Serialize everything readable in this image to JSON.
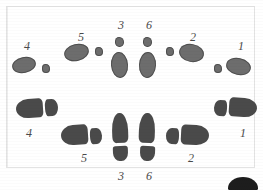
{
  "figure": {
    "background_color": "#ffffff",
    "print_fill_color": "#6d6d6d",
    "shoe_fill_color": "#4a4a4a",
    "label_color": "#4a4a4a",
    "frame_color": "#e3e3e3"
  },
  "rows": [
    {
      "name": "top-row-pad-prints",
      "kind": "pad",
      "prints": [
        {
          "id": "pad-4",
          "label": "4",
          "label_pos": {
            "x": 24,
            "y": 40
          },
          "parts": [
            {
              "part": "pad",
              "x": 12,
              "y": 57,
              "w": 24,
              "h": 16,
              "rotate": -12
            },
            {
              "part": "dot",
              "x": 42,
              "y": 64,
              "w": 8,
              "h": 9,
              "rotate": 0
            }
          ]
        },
        {
          "id": "pad-5",
          "label": "5",
          "label_pos": {
            "x": 78,
            "y": 31
          },
          "parts": [
            {
              "part": "pad",
              "x": 64,
              "y": 44,
              "w": 25,
              "h": 17,
              "rotate": -14
            },
            {
              "part": "dot",
              "x": 95,
              "y": 47,
              "w": 8,
              "h": 9,
              "rotate": 0
            }
          ]
        },
        {
          "id": "pad-3",
          "label": "3",
          "label_pos": {
            "x": 118,
            "y": 19
          },
          "parts": [
            {
              "part": "dot",
              "x": 115,
              "y": 37,
              "w": 9,
              "h": 10,
              "rotate": 0
            },
            {
              "part": "pad",
              "x": 111,
              "y": 52,
              "w": 17,
              "h": 26,
              "rotate": -4
            }
          ]
        },
        {
          "id": "pad-6",
          "label": "6",
          "label_pos": {
            "x": 146,
            "y": 19
          },
          "parts": [
            {
              "part": "dot",
              "x": 143,
              "y": 37,
              "w": 9,
              "h": 10,
              "rotate": 0
            },
            {
              "part": "pad",
              "x": 139,
              "y": 52,
              "w": 17,
              "h": 26,
              "rotate": 3
            }
          ]
        },
        {
          "id": "pad-2",
          "label": "2",
          "label_pos": {
            "x": 190,
            "y": 31
          },
          "parts": [
            {
              "part": "dot",
              "x": 166,
              "y": 47,
              "w": 8,
              "h": 9,
              "rotate": 0
            },
            {
              "part": "pad",
              "x": 179,
              "y": 44,
              "w": 25,
              "h": 18,
              "rotate": 10
            }
          ]
        },
        {
          "id": "pad-1",
          "label": "1",
          "label_pos": {
            "x": 238,
            "y": 40
          },
          "parts": [
            {
              "part": "dot",
              "x": 214,
              "y": 64,
              "w": 8,
              "h": 9,
              "rotate": 0
            },
            {
              "part": "pad",
              "x": 226,
              "y": 58,
              "w": 25,
              "h": 17,
              "rotate": 12
            }
          ]
        }
      ]
    },
    {
      "name": "bottom-row-shoe-prints",
      "kind": "shoe",
      "prints": [
        {
          "id": "shoe-4",
          "label": "4",
          "label_pos": {
            "x": 26,
            "y": 127
          },
          "parts": [
            {
              "part": "sole-left",
              "x": 16,
              "y": 99,
              "w": 27,
              "h": 19,
              "rotate": -4
            },
            {
              "part": "heel-left",
              "x": 45,
              "y": 99,
              "w": 13,
              "h": 17,
              "rotate": -4
            }
          ]
        },
        {
          "id": "shoe-5",
          "label": "5",
          "label_pos": {
            "x": 81,
            "y": 152
          },
          "parts": [
            {
              "part": "sole-left",
              "x": 61,
              "y": 125,
              "w": 27,
              "h": 20,
              "rotate": -4
            },
            {
              "part": "heel-left",
              "x": 90,
              "y": 128,
              "w": 12,
              "h": 16,
              "rotate": -4
            }
          ]
        },
        {
          "id": "shoe-3",
          "label": "3",
          "label_pos": {
            "x": 118,
            "y": 170
          },
          "parts": [
            {
              "part": "sole-up",
              "x": 112,
              "y": 113,
              "w": 16,
              "h": 30,
              "rotate": -2
            },
            {
              "part": "heel-up",
              "x": 113,
              "y": 146,
              "w": 15,
              "h": 15,
              "rotate": -2
            }
          ]
        },
        {
          "id": "shoe-6",
          "label": "6",
          "label_pos": {
            "x": 146,
            "y": 170
          },
          "parts": [
            {
              "part": "sole-up",
              "x": 139,
              "y": 113,
              "w": 16,
              "h": 30,
              "rotate": 2
            },
            {
              "part": "heel-up",
              "x": 140,
              "y": 146,
              "w": 15,
              "h": 15,
              "rotate": 2
            }
          ]
        },
        {
          "id": "shoe-2",
          "label": "2",
          "label_pos": {
            "x": 188,
            "y": 152
          },
          "parts": [
            {
              "part": "heel-right",
              "x": 166,
              "y": 128,
              "w": 13,
              "h": 16,
              "rotate": 3
            },
            {
              "part": "sole-right",
              "x": 181,
              "y": 125,
              "w": 28,
              "h": 20,
              "rotate": 3
            }
          ]
        },
        {
          "id": "shoe-1",
          "label": "1",
          "label_pos": {
            "x": 240,
            "y": 127
          },
          "parts": [
            {
              "part": "heel-right",
              "x": 214,
              "y": 100,
              "w": 13,
              "h": 16,
              "rotate": 4
            },
            {
              "part": "sole-right",
              "x": 229,
              "y": 98,
              "w": 28,
              "h": 19,
              "rotate": 4
            }
          ]
        }
      ]
    }
  ],
  "artifact": {
    "name": "scan-artifact",
    "x": 228,
    "y": 177,
    "w": 30,
    "h": 16
  }
}
